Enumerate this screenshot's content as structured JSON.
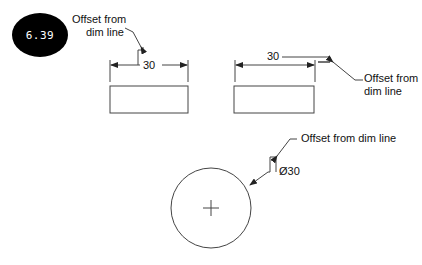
{
  "figure": {
    "badge": "6.39",
    "left_example": {
      "callout_line1": "Offset from",
      "callout_line2": "dim line",
      "dimension": "30"
    },
    "right_example": {
      "callout_line1": "Offset from",
      "callout_line2": "dim line",
      "dimension": "30"
    },
    "circle_example": {
      "callout": "Offset from dim line",
      "dimension": "Ø30"
    }
  }
}
